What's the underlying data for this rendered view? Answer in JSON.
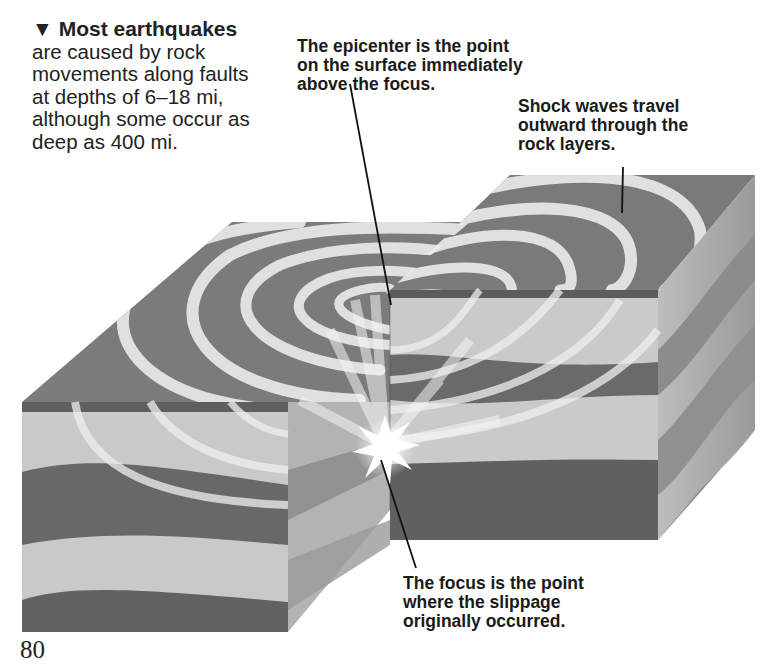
{
  "captions": {
    "main": {
      "marker": "▼",
      "heading": "Most earthquakes",
      "lines": [
        "are caused by rock",
        "movements along faults",
        "at depths of 6–18 mi,",
        "although some occur as",
        "deep as 400 mi."
      ]
    },
    "epicenter": {
      "lines": [
        "The epicenter is the point",
        "on the surface immediately",
        "above the focus."
      ]
    },
    "shock_waves": {
      "lines": [
        "Shock waves travel",
        "outward through the",
        "rock layers."
      ]
    },
    "focus": {
      "lines": [
        "The focus is the point",
        "where the slippage",
        "originally occurred."
      ]
    }
  },
  "page_number": "80",
  "colors": {
    "surface": "#7a7a7a",
    "layer_dark": "#666666",
    "layer_light": "#c8c8c8",
    "wave": "#e6e6e6"
  }
}
